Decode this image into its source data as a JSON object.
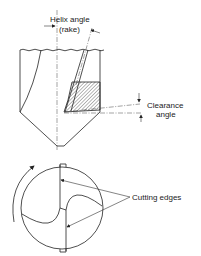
{
  "diagram": {
    "side_view": {
      "labels": {
        "helix_angle": "Helix angle",
        "rake": "(rake)",
        "clearance": "Clearance",
        "angle": "angle"
      }
    },
    "end_view": {
      "labels": {
        "cutting_edges": "Cutting edges"
      },
      "rotation_direction": "counter-clockwise"
    },
    "colors": {
      "line": "#222222",
      "background": "#ffffff"
    }
  }
}
